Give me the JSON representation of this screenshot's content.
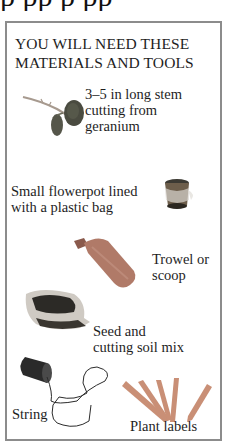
{
  "top_cropped_text": "p   pp    p  pp",
  "panel": {
    "heading_line1": "YOU WILL NEED THESE",
    "heading_line2": "MATERIALS AND TOOLS",
    "border_color": "#8c8c8c"
  },
  "items": [
    {
      "id": "cutting",
      "line1": "3–5 in long stem",
      "line2": "cutting from",
      "line3": "geranium",
      "icon": "geranium-cutting-icon"
    },
    {
      "id": "flowerpot",
      "line1": "Small flowerpot lined",
      "line2": "with a plastic bag",
      "icon": "flowerpot-icon"
    },
    {
      "id": "trowel",
      "line1": "Trowel or",
      "line2": "scoop",
      "icon": "trowel-icon"
    },
    {
      "id": "soil",
      "line1": "Seed and",
      "line2": "cutting soil mix",
      "icon": "soil-bag-icon"
    },
    {
      "id": "string",
      "line1": "String",
      "icon": "string-spool-icon"
    },
    {
      "id": "labels",
      "line1": "Plant labels",
      "icon": "plant-labels-icon"
    }
  ]
}
